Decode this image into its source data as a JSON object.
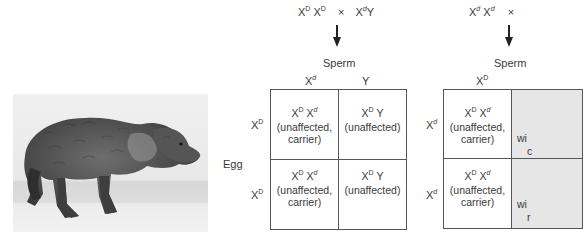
{
  "photo": {
    "subject": "dog with hunched posture and patchy coat",
    "alt": "Photograph of an affected dog"
  },
  "cross_left": {
    "mother": {
      "base": "X",
      "sup1": "D",
      "base2": "X",
      "sup2": "D"
    },
    "cross_symbol": "×",
    "father": {
      "base": "X",
      "sup1": "d",
      "tail": "Y"
    },
    "sperm_label": "Sperm",
    "egg_label": "Egg",
    "sperm_alleles": [
      {
        "base": "X",
        "sup": "d"
      },
      {
        "base": "Y",
        "sup": ""
      }
    ],
    "egg_alleles": [
      {
        "base": "X",
        "sup": "D"
      },
      {
        "base": "X",
        "sup": "D"
      }
    ],
    "cells": [
      {
        "genotype": {
          "a": "X",
          "asup": "D",
          "b": "X",
          "bsup": "d"
        },
        "line1": "(unaffected,",
        "line2": "carrier)"
      },
      {
        "genotype": {
          "a": "X",
          "asup": "D",
          "b": "Y",
          "bsup": ""
        },
        "line1": "(unaffected)",
        "line2": ""
      },
      {
        "genotype": {
          "a": "X",
          "asup": "D",
          "b": "X",
          "bsup": "d"
        },
        "line1": "(unaffected,",
        "line2": "carrier)"
      },
      {
        "genotype": {
          "a": "X",
          "asup": "D",
          "b": "Y",
          "bsup": ""
        },
        "line1": "(unaffected)",
        "line2": ""
      }
    ]
  },
  "cross_right": {
    "mother": {
      "base": "X",
      "sup1": "d",
      "base2": "X",
      "sup2": "d"
    },
    "cross_symbol": "×",
    "sperm_label": "Sperm",
    "sperm_alleles": [
      {
        "base": "X",
        "sup": "D"
      }
    ],
    "egg_alleles": [
      {
        "base": "X",
        "sup": "d"
      },
      {
        "base": "X",
        "sup": "d"
      }
    ],
    "cells": [
      {
        "genotype": {
          "a": "X",
          "asup": "D",
          "b": "X",
          "bsup": "d"
        },
        "line1": "(unaffected,",
        "line2": "carrier)"
      },
      {
        "partial_text": "wi",
        "partial_text2": "c"
      },
      {
        "genotype": {
          "a": "X",
          "asup": "D",
          "b": "X",
          "bsup": "d"
        },
        "line1": "(unaffected,",
        "line2": "carrier)"
      },
      {
        "partial_text": "wi",
        "partial_text2": "r"
      }
    ]
  },
  "colors": {
    "text": "#3a3a3a",
    "grid_line": "#555555",
    "affected_fill": "#e6e6e6",
    "photo_bg": "#ececec"
  }
}
